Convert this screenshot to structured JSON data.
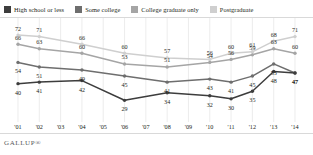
{
  "brand": {
    "text": "GALLUP®"
  },
  "legend": {
    "items": [
      {
        "label": "High school or less",
        "color": "#3d3d3d"
      },
      {
        "label": "Some college",
        "color": "#6e6e6e"
      },
      {
        "label": "College graduate only",
        "color": "#a5a5a5"
      },
      {
        "label": "Postgraduate",
        "color": "#cfcfcf"
      }
    ]
  },
  "chart_data": {
    "type": "line",
    "title": "",
    "subtitle": "",
    "xlabel": "",
    "ylabel": "",
    "grid": "vertical",
    "legend_position": "top",
    "ylim": [
      20,
      78
    ],
    "categories": [
      "'01",
      "'02",
      "'03",
      "'04",
      "'05",
      "'06",
      "'07",
      "'08",
      "'09",
      "'10",
      "'11",
      "'12",
      "'13",
      "'14"
    ],
    "series": [
      {
        "name": "High school or less",
        "color": "#3d3d3d",
        "values": [
          40,
          41,
          null,
          42,
          null,
          29,
          null,
          34,
          null,
          32,
          30,
          35,
          48,
          47
        ],
        "labels": [
          "40",
          "41",
          "",
          "42",
          "",
          "29",
          "",
          "34",
          "",
          "32",
          "30",
          "35",
          "48",
          "47"
        ]
      },
      {
        "name": "Some college",
        "color": "#6e6e6e",
        "values": [
          54,
          51,
          null,
          49,
          null,
          45,
          null,
          41,
          null,
          43,
          41,
          45,
          53,
          47
        ],
        "labels": [
          "54",
          "51",
          "",
          "49",
          "",
          "45",
          "",
          "41",
          "",
          "43",
          "41",
          "45",
          "53",
          "47"
        ]
      },
      {
        "name": "College graduate only",
        "color": "#a5a5a5",
        "values": [
          66,
          63,
          null,
          60,
          null,
          53,
          null,
          51,
          null,
          54,
          56,
          59,
          63,
          60
        ],
        "labels": [
          "66",
          "63",
          "",
          "60",
          "",
          "53",
          "",
          "51",
          "",
          "54",
          "56",
          "59",
          "63",
          "60"
        ]
      },
      {
        "name": "Postgraduate",
        "color": "#cfcfcf",
        "values": [
          72,
          71,
          null,
          66,
          null,
          60,
          null,
          57,
          null,
          56,
          60,
          61,
          68,
          71
        ],
        "labels": [
          "72",
          "71",
          "",
          "66",
          "",
          "60",
          "",
          "57",
          "",
          "56",
          "60",
          "61",
          "68",
          "71"
        ]
      }
    ]
  }
}
